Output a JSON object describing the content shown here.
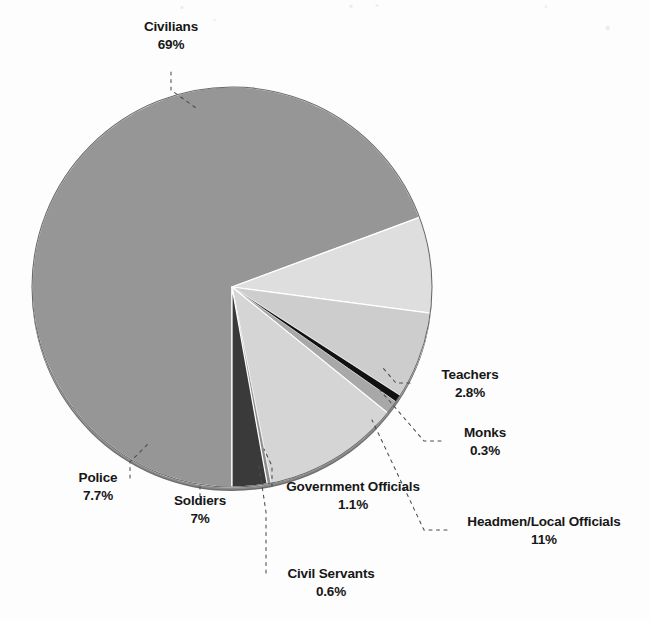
{
  "figure": {
    "background_color": "#fdfdfd",
    "pie": {
      "center_x": 232,
      "center_y": 287,
      "radius": 200,
      "rim_color": "#5b5b5b",
      "separator_color": "#ffffff",
      "start_angle_deg": 90,
      "direction": "counterclockwise"
    }
  },
  "chart_data": {
    "type": "pie",
    "title": "",
    "subtitle": "",
    "xlabel": "",
    "ylabel": "",
    "legend_position": "none",
    "labels_position": "outside-callout",
    "value_unit": "percent",
    "total": 99.5,
    "categories": [
      "Civilians",
      "Police",
      "Soldiers",
      "Civil Servants",
      "Government Officials",
      "Headmen/Local Officials",
      "Monks",
      "Teachers"
    ],
    "values": [
      69,
      7.7,
      7,
      0.6,
      1.1,
      11,
      0.3,
      2.8
    ],
    "value_labels": [
      "69%",
      "7.7%",
      "7%",
      "0.6%",
      "1.1%",
      "11%",
      "0.3%",
      "2.8%"
    ],
    "colors": [
      "#969696",
      "#dedede",
      "#cdcdcd",
      "#111111",
      "#a8a8a8",
      "#d5d5d5",
      "#8c8c8c",
      "#3a3a3a"
    ],
    "slices": [
      {
        "label": "Civilians",
        "value": 69,
        "value_label": "69%",
        "color": "#969696"
      },
      {
        "label": "Police",
        "value": 7.7,
        "value_label": "7.7%",
        "color": "#dedede"
      },
      {
        "label": "Soldiers",
        "value": 7,
        "value_label": "7%",
        "color": "#cdcdcd"
      },
      {
        "label": "Civil Servants",
        "value": 0.6,
        "value_label": "0.6%",
        "color": "#111111"
      },
      {
        "label": "Government Officials",
        "value": 1.1,
        "value_label": "1.1%",
        "color": "#a8a8a8"
      },
      {
        "label": "Headmen/Local Officials",
        "value": 11,
        "value_label": "11%",
        "color": "#d5d5d5"
      },
      {
        "label": "Monks",
        "value": 0.3,
        "value_label": "0.3%",
        "color": "#8c8c8c"
      },
      {
        "label": "Teachers",
        "value": 2.8,
        "value_label": "2.8%",
        "color": "#3a3a3a"
      }
    ]
  },
  "labels": {
    "civilians": {
      "category": "Civilians",
      "percent": "69%"
    },
    "police": {
      "category": "Police",
      "percent": "7.7%"
    },
    "soldiers": {
      "category": "Soldiers",
      "percent": "7%"
    },
    "civil_servants": {
      "category": "Civil Servants",
      "percent": "0.6%"
    },
    "government_officials": {
      "category": "Government Officials",
      "percent": "1.1%"
    },
    "headmen": {
      "category": "Headmen/Local Officials",
      "percent": "11%"
    },
    "monks": {
      "category": "Monks",
      "percent": "0.3%"
    },
    "teachers": {
      "category": "Teachers",
      "percent": "2.8%"
    }
  }
}
